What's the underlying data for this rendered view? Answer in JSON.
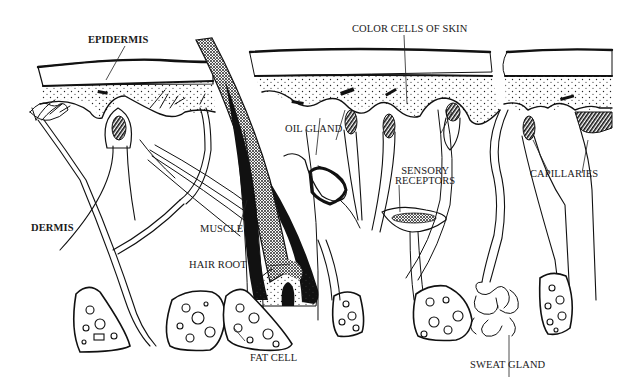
{
  "figure": {
    "colors": {
      "ink": "#111111",
      "background": "#ffffff"
    },
    "labels": {
      "epidermis": "EPIDERMIS",
      "dermis": "DERMIS",
      "color_cells": "COLOR CELLS OF SKIN",
      "oil_gland": "OIL GLAND",
      "sensory_receptors_line1": "SENSORY",
      "sensory_receptors_line2": "RECEPTORS",
      "capillaries": "CAPILLARIES",
      "muscle": "MUSCLE",
      "hair_root": "HAIR ROOT",
      "fat_cell": "FAT CELL",
      "sweat_gland": "SWEAT GLAND"
    }
  }
}
